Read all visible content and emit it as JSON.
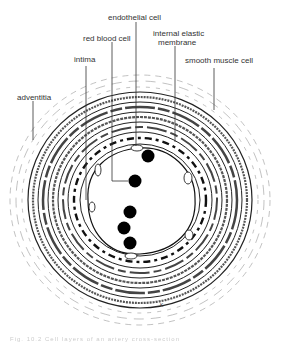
{
  "diagram": {
    "subject": "artery cross-section",
    "labels": [
      {
        "id": "endothelial-cell",
        "text": "endothelial cell"
      },
      {
        "id": "red-blood-cell",
        "text": "red blood cell"
      },
      {
        "id": "internal-elastic-membrane-1",
        "text": "internal elastic"
      },
      {
        "id": "internal-elastic-membrane-2",
        "text": "membrane"
      },
      {
        "id": "intima",
        "text": "intima"
      },
      {
        "id": "smooth-muscle-cell",
        "text": "smooth muscle cell"
      },
      {
        "id": "adventitia",
        "text": "adventitia"
      }
    ],
    "red_blood_cells": 5,
    "bottom_mark": "K",
    "caption": "Fig. 10.2  Cell layers of an artery cross-section"
  }
}
